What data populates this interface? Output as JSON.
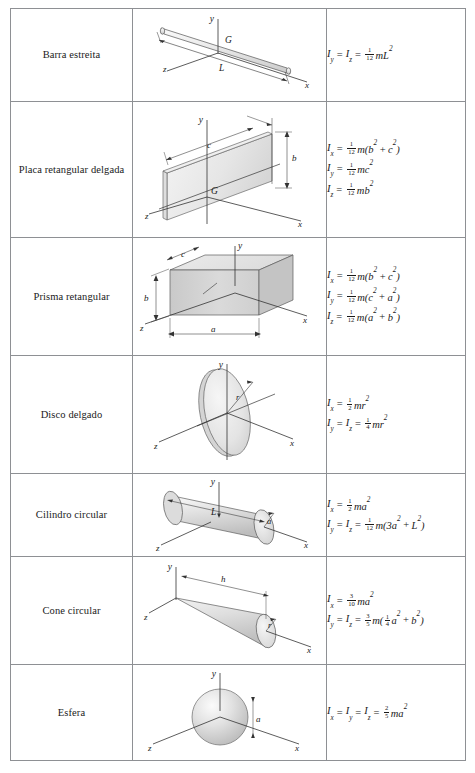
{
  "table": {
    "rows": [
      {
        "name": "Barra estreita",
        "figure": "slender-rod",
        "figure_labels": [
          "y",
          "G",
          "z",
          "L",
          "x"
        ],
        "formulas": [
          {
            "lhs": [
              "I",
              "y"
            ],
            "lhs2": [
              "I",
              "z"
            ],
            "coef_num": "1",
            "coef_den": "12",
            "rhs": "mL",
            "rhs_sup": "2"
          }
        ]
      },
      {
        "name": "Placa retangular delgada",
        "figure": "thin-rectangular-plate",
        "figure_labels": [
          "y",
          "c",
          "b",
          "G",
          "z",
          "x"
        ],
        "formulas": [
          {
            "lhs": [
              "I",
              "x"
            ],
            "coef_num": "1",
            "coef_den": "12",
            "rhs_parts": "m(b² + c²)"
          },
          {
            "lhs": [
              "I",
              "y"
            ],
            "coef_num": "1",
            "coef_den": "12",
            "rhs_parts": "mc²"
          },
          {
            "lhs": [
              "I",
              "z"
            ],
            "coef_num": "1",
            "coef_den": "12",
            "rhs_parts": "mb²"
          }
        ]
      },
      {
        "name": "Prisma retangular",
        "figure": "rectangular-prism",
        "figure_labels": [
          "y",
          "c",
          "b",
          "z",
          "a",
          "x"
        ],
        "formulas": [
          {
            "lhs": [
              "I",
              "x"
            ],
            "coef_num": "1",
            "coef_den": "12",
            "rhs_parts": "m(b² + c²)"
          },
          {
            "lhs": [
              "I",
              "y"
            ],
            "coef_num": "1",
            "coef_den": "12",
            "rhs_parts": "m(c² + a²)"
          },
          {
            "lhs": [
              "I",
              "z"
            ],
            "coef_num": "1",
            "coef_den": "12",
            "rhs_parts": "m(a² + b²)"
          }
        ]
      },
      {
        "name": "Disco delgado",
        "figure": "thin-disk",
        "figure_labels": [
          "y",
          "r",
          "z",
          "x"
        ],
        "formulas": [
          {
            "lhs": [
              "I",
              "x"
            ],
            "coef_num": "1",
            "coef_den": "2",
            "rhs_parts": "mr²"
          },
          {
            "lhs": [
              "I",
              "y"
            ],
            "lhs2": [
              "I",
              "z"
            ],
            "coef_num": "1",
            "coef_den": "4",
            "rhs_parts": "mr²"
          }
        ]
      },
      {
        "name": "Cilindro circular",
        "figure": "circular-cylinder",
        "figure_labels": [
          "y",
          "L",
          "a",
          "z",
          "x"
        ],
        "formulas": [
          {
            "lhs": [
              "I",
              "x"
            ],
            "coef_num": "1",
            "coef_den": "2",
            "rhs_parts": "ma²"
          },
          {
            "lhs": [
              "I",
              "y"
            ],
            "lhs2": [
              "I",
              "z"
            ],
            "coef_num": "1",
            "coef_den": "12",
            "rhs_parts": "m(3a² + L²)"
          }
        ]
      },
      {
        "name": "Cone circular",
        "figure": "circular-cone",
        "figure_labels": [
          "y",
          "h",
          "z",
          "r",
          "x"
        ],
        "formulas": [
          {
            "lhs": [
              "I",
              "x"
            ],
            "coef_num": "3",
            "coef_den": "10",
            "rhs_parts": "ma²"
          },
          {
            "lhs": [
              "I",
              "y"
            ],
            "lhs2": [
              "I",
              "z"
            ],
            "coef_num": "3",
            "coef_den": "5",
            "rhs_parts": "m(¼a² + b²)"
          }
        ]
      },
      {
        "name": "Esfera",
        "figure": "sphere",
        "figure_labels": [
          "y",
          "a",
          "z",
          "x"
        ],
        "formulas": [
          {
            "lhs": [
              "I",
              "x"
            ],
            "lhs2": [
              "I",
              "y"
            ],
            "lhs3": [
              "I",
              "z"
            ],
            "coef_num": "2",
            "coef_den": "5",
            "rhs_parts": "ma²"
          }
        ]
      }
    ]
  },
  "symbols": {
    "I": "I",
    "m": "m",
    "L": "L",
    "a": "a",
    "b": "b",
    "c": "c",
    "r": "r",
    "h": "h",
    "G": "G",
    "x": "x",
    "y": "y",
    "z": "z",
    "equals": "=",
    "plus": "+",
    "sq": "2",
    "three": "3"
  },
  "colors": {
    "border": "#8e9094",
    "text": "#1a1a1a",
    "figure_line": "#3a3a3a",
    "figure_fill_light": "#f0f0f0",
    "figure_fill_mid": "#dcdcdc",
    "figure_fill_dark": "#c3c3c3",
    "page_bg": "#ffffff"
  }
}
